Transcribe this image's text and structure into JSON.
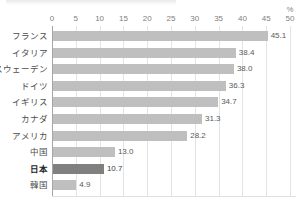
{
  "title_remnant": "",
  "colors": {
    "bar": "#bfbfbf",
    "bar_highlight": "#808080",
    "gridline": "#e3e3e3",
    "axis": "#a6a6a6",
    "text": "#595959"
  },
  "axis": {
    "unit_label": "%",
    "ticks": [
      "0",
      "5",
      "10",
      "15",
      "20",
      "25",
      "30",
      "35",
      "40",
      "45",
      "50"
    ]
  },
  "highlight_category": "日本",
  "chart_data": {
    "type": "bar",
    "orientation": "horizontal",
    "title": "",
    "xlabel": "%",
    "ylabel": "",
    "xlim": [
      0,
      50
    ],
    "xticks": [
      0,
      5,
      10,
      15,
      20,
      25,
      30,
      35,
      40,
      45,
      50
    ],
    "grid": true,
    "legend": false,
    "categories": [
      "フランス",
      "イタリア",
      "スウェーデン",
      "ドイツ",
      "イギリス",
      "カナダ",
      "アメリカ",
      "中国",
      "日本",
      "韓国"
    ],
    "values": [
      45.1,
      38.4,
      38.0,
      36.3,
      34.7,
      31.3,
      28.2,
      13.0,
      10.7,
      4.9
    ],
    "value_labels": [
      "45.1",
      "38.4",
      "38.0",
      "36.3",
      "34.7",
      "31.3",
      "28.2",
      "13.0",
      "10.7",
      "4.9"
    ],
    "highlighted": [
      false,
      false,
      false,
      false,
      false,
      false,
      false,
      false,
      true,
      false
    ]
  }
}
